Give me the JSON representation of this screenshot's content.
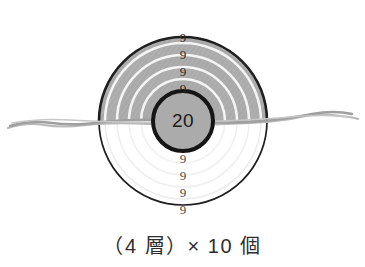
{
  "figure": {
    "title": "",
    "caption": "（4 層）× 10 個",
    "core": {
      "value": "20",
      "name": "core-circle"
    },
    "colors": {
      "shell_fill": "#a9a9a9",
      "shell_fill_light": "#b2b2b2",
      "core_fill": "#aaaaaa",
      "outline": "#1f1f1f",
      "separator": "#f2f2f2",
      "below_arc": "#e8e8e8",
      "ground_line": "#9a9a9a",
      "background": "#ffffff",
      "text": "#2b2b2b"
    },
    "geometry": {
      "outer_center_x": 183,
      "outer_center_y": 121,
      "outer_radius": 84,
      "core_radius": 30,
      "ground_line_y": 121
    },
    "upper_layers": [
      {
        "label": "9",
        "radius": 78,
        "label_y": 39
      },
      {
        "label": "9",
        "radius": 66,
        "label_y": 56
      },
      {
        "label": "9",
        "radius": 54,
        "label_y": 73
      },
      {
        "label": "9",
        "radius": 42,
        "label_y": 90
      }
    ],
    "lower_layers": [
      {
        "label": "9",
        "radius": 42,
        "label_y": 160
      },
      {
        "label": "9",
        "radius": 54,
        "label_y": 177
      },
      {
        "label": "9",
        "radius": 66,
        "label_y": 194
      },
      {
        "label": "9",
        "radius": 78,
        "label_y": 211
      }
    ],
    "ground": {
      "name": "ground-wavy-line",
      "label": ""
    }
  }
}
